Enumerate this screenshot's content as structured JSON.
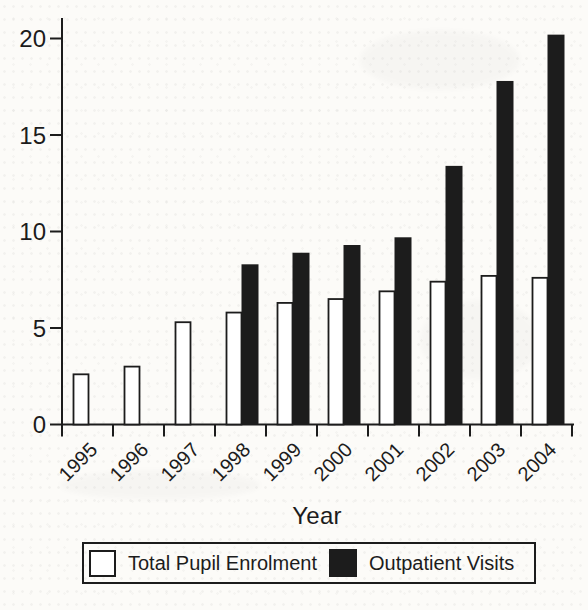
{
  "figure": {
    "paper_color": "#fcfbf8",
    "ink_color": "#1c1c1c"
  },
  "chart_data": {
    "type": "bar",
    "title": "",
    "xlabel": "Year",
    "ylabel": "",
    "categories": [
      "1995",
      "1996",
      "1997",
      "1998",
      "1999",
      "2000",
      "2001",
      "2002",
      "2003",
      "2004"
    ],
    "series": [
      {
        "name": "Total Pupil Enrolment",
        "fill": "#ffffff",
        "values": [
          2.6,
          3.0,
          5.3,
          5.8,
          6.3,
          6.5,
          6.9,
          7.4,
          7.7,
          7.6
        ]
      },
      {
        "name": "Outpatient Visits",
        "fill": "#1c1c1c",
        "values": [
          0,
          0,
          0,
          8.3,
          8.9,
          9.3,
          9.7,
          13.4,
          17.8,
          20.2
        ]
      }
    ],
    "ylim": [
      0,
      20
    ],
    "yticks": [
      0,
      5,
      10,
      15,
      20
    ],
    "grid": false,
    "legend_position": "bottom"
  }
}
